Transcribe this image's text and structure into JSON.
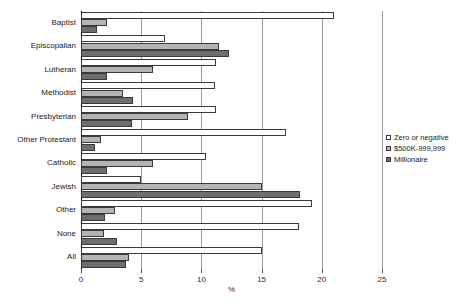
{
  "chart_data": {
    "type": "bar",
    "orientation": "horizontal",
    "title": "",
    "xlabel": "%",
    "ylabel": "",
    "xlim": [
      0,
      25
    ],
    "xticks": [
      0,
      5,
      10,
      15,
      20,
      25
    ],
    "xtick_labels": [
      "0",
      "5",
      "10",
      "15",
      "20",
      "25"
    ],
    "grid": true,
    "legend_position": "right",
    "categories": [
      "Baptist",
      "Episcopalian",
      "Lutheran",
      "Methodist",
      "Presbyterian",
      "Other Protestant",
      "Catholic",
      "Jewish",
      "Other",
      "None",
      "All"
    ],
    "series": [
      {
        "name": "Zero or negative",
        "color": "#ffffff",
        "values": [
          21.0,
          7.0,
          11.2,
          11.1,
          11.2,
          17.0,
          10.4,
          5.0,
          19.2,
          18.1,
          15.0
        ]
      },
      {
        "name": "$500K-999,999",
        "color": "#b4b4b4",
        "values": [
          2.2,
          11.5,
          6.0,
          3.5,
          8.9,
          1.7,
          6.0,
          15.0,
          2.8,
          1.9,
          4.0
        ]
      },
      {
        "name": "Millionaire",
        "color": "#6e6e6e",
        "values": [
          1.3,
          12.3,
          2.2,
          4.3,
          4.2,
          1.2,
          2.2,
          18.2,
          2.0,
          3.0,
          3.7
        ]
      }
    ]
  },
  "legend": {
    "items": [
      {
        "label": "Zero or negative"
      },
      {
        "label": "$500K-999,999"
      },
      {
        "label": "Millionaire"
      }
    ]
  },
  "axis": {
    "x_title": "%"
  }
}
